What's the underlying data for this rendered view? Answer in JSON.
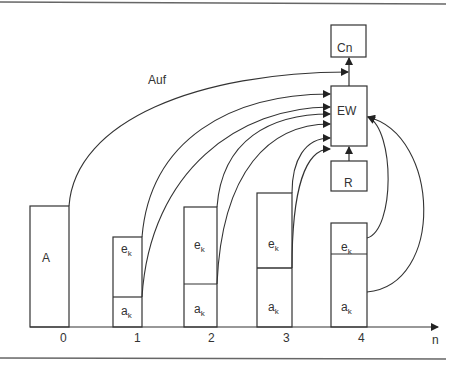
{
  "diagram": {
    "top_label": "Auf",
    "axis": {
      "label": "n",
      "ticks": [
        "0",
        "1",
        "2",
        "3",
        "4"
      ]
    },
    "boxes": {
      "cn": "Cn",
      "ew": "EW",
      "r": "R",
      "a": "A"
    },
    "stacks": [
      {
        "index": "1",
        "upper": "e",
        "upper_sub": "k",
        "lower": "a",
        "lower_sub": "k"
      },
      {
        "index": "2",
        "upper": "e",
        "upper_sub": "k",
        "lower": "a",
        "lower_sub": "k"
      },
      {
        "index": "3",
        "upper": "e",
        "upper_sub": "k",
        "lower": "a",
        "lower_sub": "k"
      },
      {
        "index": "4",
        "upper": "e",
        "upper_sub": "k",
        "lower": "a",
        "lower_sub": "k"
      }
    ],
    "colors": {
      "stroke": "#333333",
      "background": "#ffffff",
      "rule": "#666666"
    }
  }
}
